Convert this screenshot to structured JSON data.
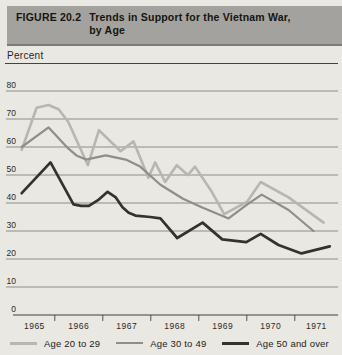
{
  "header": {
    "figure_label": "FIGURE 20.2",
    "title_line1": "Trends in Support for the Vietnam War,",
    "title_line2": "by Age"
  },
  "colors": {
    "background": "#eae8e2",
    "header_bg": "#a3a29e",
    "grid": "#6f6d68",
    "axis": "#403e39",
    "text": "#1c1b17"
  },
  "chart_data": {
    "type": "line",
    "title": "Trends in Support for the Vietnam War, by Age",
    "ylabel": "Percent",
    "ylim": [
      0,
      80
    ],
    "y_ticks": [
      0,
      10,
      20,
      30,
      40,
      50,
      60,
      70,
      80
    ],
    "x_domain": [
      1965.15,
      1971.9
    ],
    "x_tick_years": [
      1966,
      1967,
      1968,
      1969,
      1970,
      1971
    ],
    "x_label_years": [
      "1965",
      "1966",
      "1967",
      "1968",
      "1969",
      "1970",
      "1971"
    ],
    "grid": true,
    "legend_position": "bottom",
    "series": [
      {
        "name": "Age 20 to 29",
        "color": "#b8b6b1",
        "width": 2.6,
        "points": [
          [
            1965.31,
            59
          ],
          [
            1965.62,
            74
          ],
          [
            1965.87,
            75
          ],
          [
            1966.08,
            73.5
          ],
          [
            1966.28,
            69
          ],
          [
            1966.69,
            53.5
          ],
          [
            1966.92,
            66
          ],
          [
            1967.37,
            58.5
          ],
          [
            1967.64,
            62
          ],
          [
            1967.95,
            49
          ],
          [
            1968.09,
            54.5
          ],
          [
            1968.3,
            47.5
          ],
          [
            1968.54,
            53.5
          ],
          [
            1968.77,
            50
          ],
          [
            1968.92,
            53
          ],
          [
            1969.27,
            44
          ],
          [
            1969.53,
            36
          ],
          [
            1970.01,
            40.5
          ],
          [
            1970.29,
            47.5
          ],
          [
            1970.87,
            42
          ],
          [
            1971.6,
            33
          ]
        ]
      },
      {
        "name": "Age 30 to 49",
        "color": "#908e89",
        "width": 2.2,
        "points": [
          [
            1965.31,
            60
          ],
          [
            1965.87,
            67
          ],
          [
            1966.28,
            59.5
          ],
          [
            1966.45,
            57
          ],
          [
            1966.65,
            55.5
          ],
          [
            1967.06,
            57
          ],
          [
            1967.48,
            55.5
          ],
          [
            1967.78,
            53
          ],
          [
            1968.2,
            46.5
          ],
          [
            1968.67,
            41.5
          ],
          [
            1969.06,
            38.5
          ],
          [
            1969.62,
            34.5
          ],
          [
            1970.01,
            39.5
          ],
          [
            1970.31,
            43
          ],
          [
            1970.87,
            37.5
          ],
          [
            1971.39,
            30
          ]
        ]
      },
      {
        "name": "Age 50 and over",
        "color": "#34322d",
        "width": 2.7,
        "points": [
          [
            1965.31,
            43.5
          ],
          [
            1965.91,
            54.5
          ],
          [
            1966.39,
            39.5
          ],
          [
            1966.55,
            39
          ],
          [
            1966.71,
            39
          ],
          [
            1966.9,
            41
          ],
          [
            1967.1,
            44
          ],
          [
            1967.27,
            42
          ],
          [
            1967.41,
            38.5
          ],
          [
            1967.54,
            36.5
          ],
          [
            1967.68,
            35.5
          ],
          [
            1967.99,
            35
          ],
          [
            1968.2,
            34.5
          ],
          [
            1968.55,
            27.5
          ],
          [
            1969.08,
            33
          ],
          [
            1969.49,
            27
          ],
          [
            1969.99,
            26
          ],
          [
            1970.29,
            29
          ],
          [
            1970.66,
            25
          ],
          [
            1971.14,
            22
          ],
          [
            1971.73,
            24.5
          ]
        ]
      }
    ]
  }
}
